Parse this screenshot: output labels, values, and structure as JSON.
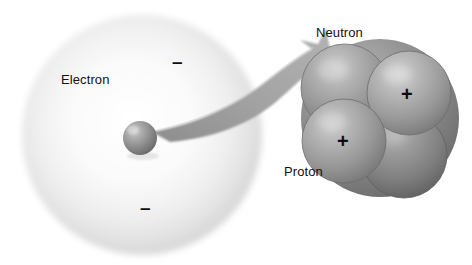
{
  "figure": {
    "background_color": "#ffffff"
  },
  "electron_cloud": {
    "name": "electron cloud",
    "label": "Electron",
    "center": {
      "x": 142,
      "y": 135
    },
    "radius": 120,
    "fill_center_color": "#ffffff",
    "fill_edge_color": "#d8d8d8"
  },
  "center_particle": {
    "name": "nucleus point",
    "center": {
      "x": 140,
      "y": 138
    },
    "radius": 17,
    "color": "#8e8e8e",
    "highlight_color": "#c9c9c9"
  },
  "electron_charges": [
    {
      "symbol": "–",
      "x": 172,
      "y": 52
    },
    {
      "symbol": "–",
      "x": 140,
      "y": 198
    }
  ],
  "zoom_arrow": {
    "name": "magnification arrow",
    "from": {
      "x": 155,
      "y": 131
    },
    "to": {
      "x": 318,
      "y": 45
    },
    "color": "#9a9a9a",
    "edge_color": "#bdbdbd"
  },
  "nucleus": {
    "name": "nucleus cluster",
    "center": {
      "x": 380,
      "y": 118
    },
    "radius": 79,
    "back_sphere_color": "#8a8a8a",
    "particles": [
      {
        "id": "neutron-top-left",
        "type": "Neutron",
        "charge": "",
        "center": {
          "x": 345,
          "y": 88
        },
        "radius": 44,
        "color": "#9b9b9b",
        "highlight": "#c3c3c3"
      },
      {
        "id": "proton-top-right",
        "type": "Proton",
        "charge": "+",
        "center": {
          "x": 409,
          "y": 93
        },
        "radius": 42,
        "color": "#a0a0a0",
        "highlight": "#c8c8c8"
      },
      {
        "id": "proton-bottom-left",
        "type": "Proton",
        "charge": "+",
        "center": {
          "x": 344,
          "y": 141
        },
        "radius": 42,
        "color": "#9d9d9d",
        "highlight": "#c6c6c6"
      },
      {
        "id": "neutron-bottom-right",
        "type": "Neutron",
        "charge": "",
        "center": {
          "x": 404,
          "y": 155
        },
        "radius": 43,
        "color": "#848484",
        "highlight": "#a8a8a8"
      }
    ],
    "charge_marks": [
      {
        "symbol": "+",
        "x": 401,
        "y": 84
      },
      {
        "symbol": "+",
        "x": 337,
        "y": 131
      }
    ]
  },
  "labels": {
    "electron": {
      "text": "Electron",
      "x": 61,
      "y": 72
    },
    "neutron": {
      "text": "Neutron",
      "x": 316,
      "y": 25
    },
    "proton": {
      "text": "Proton",
      "x": 284,
      "y": 164
    }
  }
}
